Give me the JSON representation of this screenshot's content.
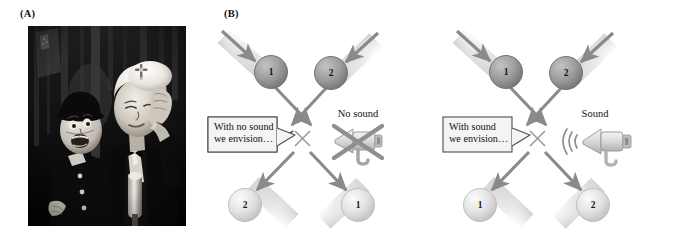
{
  "figure": {
    "panels": [
      {
        "id": "A",
        "label": "(A)",
        "type": "photograph",
        "description": "black-and-white photo of a ventriloquist holding his head beside a ventriloquist dummy"
      },
      {
        "id": "B",
        "label": "(B)",
        "type": "diagram"
      }
    ]
  },
  "colors": {
    "arrow": "#8c8c8c",
    "arrow_dark": "#7a7a7a",
    "ball_dark": "#9a9a9a",
    "ball_dark_edge": "#6f6f6f",
    "ball_light": "#dcdcdc",
    "ball_light_edge": "#b4b4b4",
    "trail": "#e7e7e7",
    "cross_mark": "#9a9a9a",
    "callout_border": "#4d4d4d",
    "callout_fill": "#f2f2f2",
    "megaphone": "#d9d9d9",
    "megaphone_edge": "#9b9b9b",
    "cross_out": "#8f8f8f",
    "text": "#111111",
    "photo_bg": "#050505"
  },
  "diagram": {
    "scenes": [
      {
        "name": "no-sound-scene",
        "callout": {
          "line1": "With no sound",
          "line2": "we envision…"
        },
        "sound_label": "No sound",
        "sound_state": "muted",
        "balls": {
          "top_left": "1",
          "top_right": "2",
          "bottom_left": "2",
          "bottom_right": "1"
        },
        "collision_marker": "×"
      },
      {
        "name": "sound-scene",
        "callout": {
          "line1": "With sound",
          "line2": "we envision…"
        },
        "sound_label": "Sound",
        "sound_state": "audible",
        "balls": {
          "top_left": "1",
          "top_right": "2",
          "bottom_left": "1",
          "bottom_right": "2"
        },
        "collision_marker": "×"
      }
    ]
  }
}
